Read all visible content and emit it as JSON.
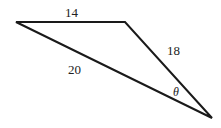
{
  "diagram": {
    "type": "triangle",
    "vertices": [
      [
        16,
        22
      ],
      [
        125,
        22
      ],
      [
        212,
        118
      ]
    ],
    "sides": [
      {
        "label": "14",
        "between": "top-left to top-right"
      },
      {
        "label": "18",
        "between": "top-right to bottom-right"
      },
      {
        "label": "20",
        "between": "top-left to bottom-right"
      }
    ],
    "angle": {
      "label": "θ",
      "at": "bottom-right vertex"
    },
    "colors": {
      "line": "#1a1a1a",
      "background": "#ffffff"
    }
  }
}
